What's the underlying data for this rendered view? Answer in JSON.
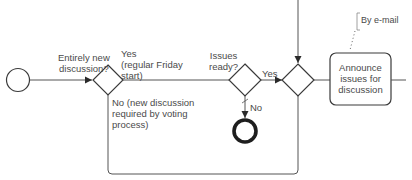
{
  "diagram": {
    "type": "bpmn-process-fragment",
    "colors": {
      "stroke": "#3a3a3a",
      "text": "#4a4a4a",
      "background": "#ffffff"
    },
    "start_event": {
      "id": "start"
    },
    "gateway_new_discussion": {
      "question": [
        "Entirely new",
        "discussion?"
      ],
      "yes_label": [
        "Yes",
        "(regular Friday",
        "start)"
      ],
      "no_label": [
        "No (new discussion",
        "required by voting",
        "process)"
      ]
    },
    "gateway_issues_ready": {
      "question": [
        "Issues",
        "ready?"
      ],
      "yes_label": "Yes",
      "no_label": "No"
    },
    "merge_gateway": {
      "id": "merge"
    },
    "end_event": {
      "id": "end"
    },
    "task_announce": {
      "label": [
        "Announce",
        "issues for",
        "discussion"
      ]
    },
    "annotation": {
      "text": "By e-mail"
    }
  }
}
